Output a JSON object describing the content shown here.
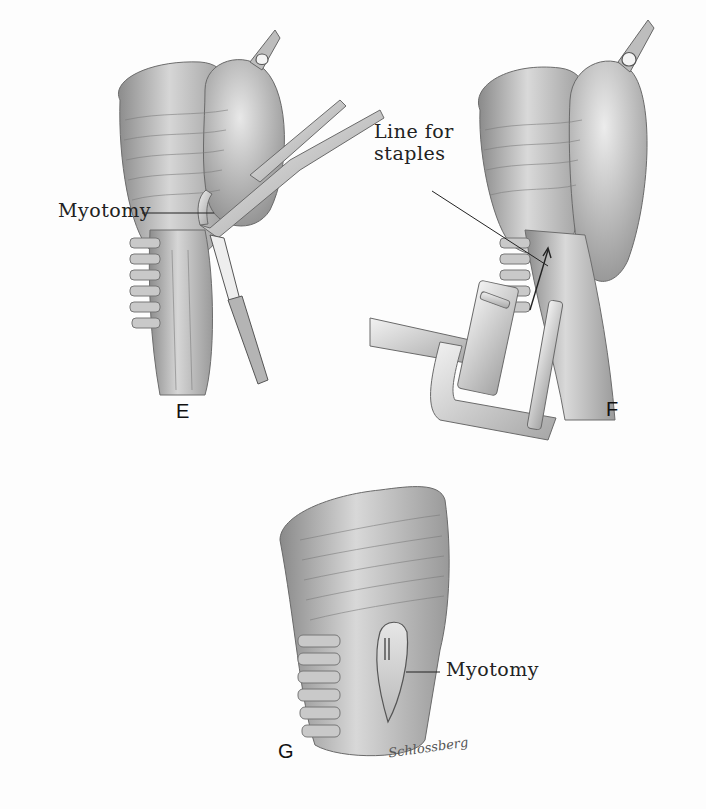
{
  "figure": {
    "panels": [
      {
        "id": "E",
        "letter": "E",
        "callouts": [
          {
            "label": "Myotomy"
          }
        ]
      },
      {
        "id": "F",
        "letter": "F",
        "callouts": [
          {
            "label": "Line for\nstaples",
            "line1": "Line for",
            "line2": "staples"
          }
        ]
      },
      {
        "id": "G",
        "letter": "G",
        "callouts": [
          {
            "label": "Myotomy"
          }
        ]
      }
    ],
    "signature": "Schlossberg",
    "palette": {
      "background": "#fdfdfd",
      "tissue_light": "#d9d9d9",
      "tissue_mid": "#a8a8a8",
      "tissue_dark": "#5a5a5a",
      "ink": "#222222"
    }
  }
}
